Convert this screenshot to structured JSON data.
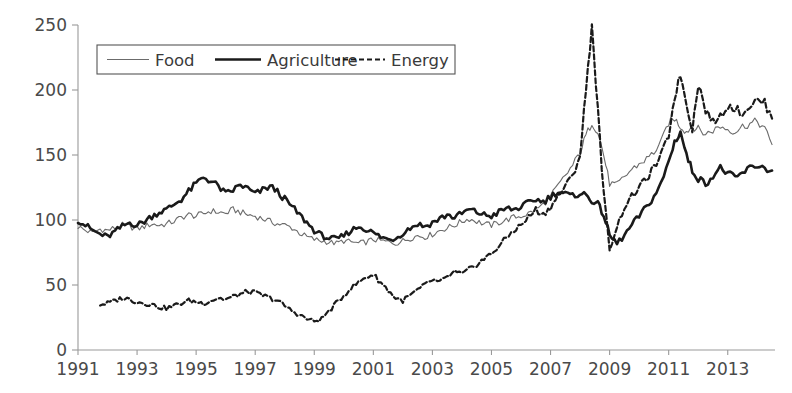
{
  "chart_data": {
    "type": "line",
    "title": "",
    "xlabel": "",
    "ylabel": "",
    "xlim": [
      1991.0,
      2014.6
    ],
    "ylim": [
      0,
      250
    ],
    "grid": false,
    "legend_position": "top-left",
    "xticks": [
      "1991",
      "1993",
      "1995",
      "1997",
      "1999",
      "2001",
      "2003",
      "2005",
      "2007",
      "2009",
      "2011",
      "2013"
    ],
    "xtick_values": [
      1991,
      1993,
      1995,
      1997,
      1999,
      2001,
      2003,
      2005,
      2007,
      2009,
      2011,
      2013
    ],
    "yticks": [
      "0",
      "50",
      "100",
      "150",
      "200",
      "250"
    ],
    "ytick_values": [
      0,
      50,
      100,
      150,
      200,
      250
    ],
    "series": [
      {
        "name": "Food",
        "style": "solid-thin",
        "color": "#6b6b6b",
        "width": 1.1,
        "x": [
          1991.0,
          1991.25,
          1991.5,
          1991.75,
          1992.0,
          1992.25,
          1992.5,
          1992.75,
          1993.0,
          1993.25,
          1993.5,
          1993.75,
          1994.0,
          1994.25,
          1994.5,
          1994.75,
          1995.0,
          1995.25,
          1995.5,
          1995.75,
          1996.0,
          1996.25,
          1996.5,
          1996.75,
          1997.0,
          1997.25,
          1997.5,
          1997.75,
          1998.0,
          1998.25,
          1998.5,
          1998.75,
          1999.0,
          1999.25,
          1999.5,
          1999.75,
          2000.0,
          2000.25,
          2000.5,
          2000.75,
          2001.0,
          2001.25,
          2001.5,
          2001.75,
          2002.0,
          2002.25,
          2002.5,
          2002.75,
          2003.0,
          2003.25,
          2003.5,
          2003.75,
          2004.0,
          2004.25,
          2004.5,
          2004.75,
          2005.0,
          2005.25,
          2005.5,
          2005.75,
          2006.0,
          2006.25,
          2006.5,
          2006.75,
          2007.0,
          2007.25,
          2007.5,
          2007.75,
          2008.0,
          2008.2,
          2008.4,
          2008.6,
          2008.8,
          2009.0,
          2009.25,
          2009.5,
          2009.75,
          2010.0,
          2010.25,
          2010.5,
          2010.75,
          2011.0,
          2011.2,
          2011.4,
          2011.6,
          2011.8,
          2012.0,
          2012.25,
          2012.5,
          2012.75,
          2013.0,
          2013.25,
          2013.5,
          2013.75,
          2014.0,
          2014.25,
          2014.5
        ],
        "y": [
          95,
          92,
          90,
          93,
          92,
          94,
          96,
          95,
          93,
          95,
          97,
          96,
          97,
          99,
          102,
          104,
          103,
          105,
          107,
          106,
          105,
          108,
          106,
          104,
          103,
          101,
          99,
          97,
          96,
          94,
          90,
          87,
          85,
          84,
          83,
          82,
          84,
          83,
          82,
          83,
          85,
          84,
          83,
          82,
          84,
          86,
          88,
          87,
          89,
          92,
          94,
          96,
          99,
          101,
          99,
          97,
          96,
          98,
          100,
          102,
          103,
          105,
          108,
          112,
          118,
          126,
          134,
          142,
          152,
          165,
          175,
          168,
          150,
          128,
          127,
          133,
          139,
          143,
          147,
          152,
          160,
          175,
          178,
          172,
          168,
          172,
          170,
          166,
          169,
          172,
          170,
          168,
          172,
          174,
          176,
          170,
          158
        ]
      },
      {
        "name": "Agriculture",
        "style": "solid-thick",
        "color": "#1a1a1a",
        "width": 2.6,
        "x": [
          1991.0,
          1991.25,
          1991.5,
          1991.75,
          1992.0,
          1992.25,
          1992.5,
          1992.75,
          1993.0,
          1993.25,
          1993.5,
          1993.75,
          1994.0,
          1994.25,
          1994.5,
          1994.75,
          1995.0,
          1995.25,
          1995.5,
          1995.75,
          1996.0,
          1996.25,
          1996.5,
          1996.75,
          1997.0,
          1997.25,
          1997.5,
          1997.75,
          1998.0,
          1998.25,
          1998.5,
          1998.75,
          1999.0,
          1999.25,
          1999.5,
          1999.75,
          2000.0,
          2000.25,
          2000.5,
          2000.75,
          2001.0,
          2001.25,
          2001.5,
          2001.75,
          2002.0,
          2002.25,
          2002.5,
          2002.75,
          2003.0,
          2003.25,
          2003.5,
          2003.75,
          2004.0,
          2004.25,
          2004.5,
          2004.75,
          2005.0,
          2005.25,
          2005.5,
          2005.75,
          2006.0,
          2006.25,
          2006.5,
          2006.75,
          2007.0,
          2007.25,
          2007.5,
          2007.75,
          2008.0,
          2008.2,
          2008.4,
          2008.6,
          2008.8,
          2009.0,
          2009.25,
          2009.5,
          2009.75,
          2010.0,
          2010.25,
          2010.5,
          2010.75,
          2011.0,
          2011.2,
          2011.4,
          2011.6,
          2011.8,
          2012.0,
          2012.25,
          2012.5,
          2012.75,
          2013.0,
          2013.25,
          2013.5,
          2013.75,
          2014.0,
          2014.25,
          2014.5
        ],
        "y": [
          100,
          96,
          92,
          89,
          87,
          91,
          95,
          98,
          96,
          99,
          103,
          106,
          108,
          112,
          116,
          122,
          128,
          133,
          130,
          126,
          120,
          123,
          127,
          124,
          120,
          123,
          126,
          122,
          116,
          110,
          104,
          98,
          92,
          88,
          86,
          85,
          88,
          92,
          95,
          93,
          90,
          87,
          85,
          86,
          90,
          94,
          97,
          95,
          98,
          101,
          104,
          102,
          105,
          108,
          106,
          104,
          103,
          106,
          109,
          108,
          110,
          113,
          116,
          114,
          118,
          122,
          120,
          118,
          121,
          119,
          115,
          112,
          104,
          88,
          82,
          88,
          96,
          103,
          110,
          118,
          128,
          145,
          160,
          168,
          150,
          138,
          132,
          128,
          134,
          140,
          136,
          132,
          136,
          140,
          142,
          140,
          138
        ]
      },
      {
        "name": "Energy",
        "style": "dashed",
        "color": "#1a1a1a",
        "width": 2.2,
        "x": [
          1991.75,
          1992.0,
          1992.25,
          1992.5,
          1992.75,
          1993.0,
          1993.25,
          1993.5,
          1993.75,
          1994.0,
          1994.25,
          1994.5,
          1994.75,
          1995.0,
          1995.25,
          1995.5,
          1995.75,
          1996.0,
          1996.25,
          1996.5,
          1996.75,
          1997.0,
          1997.25,
          1997.5,
          1997.75,
          1998.0,
          1998.25,
          1998.5,
          1998.75,
          1999.0,
          1999.25,
          1999.5,
          1999.75,
          2000.0,
          2000.25,
          2000.5,
          2000.75,
          2001.0,
          2001.25,
          2001.5,
          2001.75,
          2002.0,
          2002.25,
          2002.5,
          2002.75,
          2003.0,
          2003.25,
          2003.5,
          2003.75,
          2004.0,
          2004.25,
          2004.5,
          2004.75,
          2005.0,
          2005.25,
          2005.5,
          2005.75,
          2006.0,
          2006.25,
          2006.5,
          2006.75,
          2007.0,
          2007.25,
          2007.5,
          2007.75,
          2008.0,
          2008.2,
          2008.4,
          2008.6,
          2008.8,
          2009.0,
          2009.25,
          2009.5,
          2009.75,
          2010.0,
          2010.25,
          2010.5,
          2010.75,
          2011.0,
          2011.2,
          2011.4,
          2011.6,
          2011.8,
          2012.0,
          2012.25,
          2012.5,
          2012.75,
          2013.0,
          2013.25,
          2013.5,
          2013.75,
          2014.0,
          2014.25,
          2014.5
        ],
        "y": [
          35,
          36,
          38,
          40,
          39,
          37,
          36,
          35,
          33,
          32,
          34,
          36,
          38,
          37,
          36,
          38,
          40,
          39,
          41,
          43,
          45,
          44,
          42,
          40,
          38,
          34,
          30,
          27,
          24,
          22,
          24,
          30,
          36,
          42,
          48,
          52,
          56,
          58,
          52,
          46,
          40,
          38,
          42,
          46,
          50,
          54,
          52,
          56,
          60,
          58,
          62,
          66,
          70,
          74,
          80,
          86,
          92,
          96,
          102,
          108,
          104,
          110,
          118,
          126,
          134,
          150,
          200,
          250,
          185,
          120,
          78,
          95,
          110,
          118,
          125,
          132,
          140,
          150,
          165,
          195,
          212,
          190,
          170,
          205,
          185,
          175,
          180,
          188,
          186,
          182,
          188,
          192,
          190,
          178
        ]
      }
    ]
  },
  "legend": {
    "items": [
      {
        "label": "Food",
        "style": "solid-thin"
      },
      {
        "label": "Agriculture",
        "style": "solid-thick"
      },
      {
        "label": "Energy",
        "style": "dashed"
      }
    ]
  },
  "colors": {
    "axis": "#9a9a9a",
    "tick_text": "#4a4a4a",
    "food": "#6b6b6b",
    "agriculture": "#1a1a1a",
    "energy": "#1a1a1a",
    "legend_border": "#555555",
    "background": "#ffffff"
  }
}
